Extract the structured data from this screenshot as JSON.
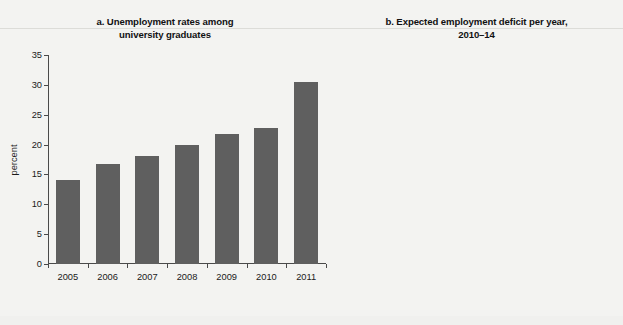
{
  "figure": {
    "background_color": "#f3f3f1",
    "panels": [
      {
        "id": "a",
        "title_lines": [
          "a.  Unemployment rates among",
          "university graduates"
        ]
      },
      {
        "id": "b",
        "title_lines": [
          "b.  Expected employment deficit per year,",
          "2010–14"
        ]
      }
    ]
  },
  "chart_data": [
    {
      "type": "bar",
      "panel": "a",
      "title": "a. Unemployment rates among university graduates",
      "xlabel": "",
      "ylabel": "percent",
      "categories": [
        "2005",
        "2006",
        "2007",
        "2008",
        "2009",
        "2010",
        "2011"
      ],
      "values": [
        14.0,
        16.8,
        18.1,
        19.9,
        21.8,
        22.8,
        30.5
      ],
      "ylim": [
        0,
        35
      ],
      "yticks": [
        0,
        5,
        10,
        15,
        20,
        25,
        30,
        35
      ],
      "ytick_labels": [
        "0",
        "5",
        "10",
        "15",
        "20",
        "25",
        "30",
        "35"
      ],
      "grid": false,
      "legend": null,
      "bar_color": "#5f5f5f"
    },
    {
      "type": "bar",
      "panel": "b",
      "title": "b. Expected employment deficit per year, 2010-14",
      "xlabel": "",
      "ylabel": "percent",
      "categories": [
        "primary",
        "basic",
        "secondary and vocational",
        "tertiary"
      ],
      "category_label_lines": [
        [
          "primary"
        ],
        [
          "basic"
        ],
        [
          "secondary",
          "and",
          "vocational"
        ],
        [
          "tertiary"
        ]
      ],
      "values": [
        6.0,
        -2.0,
        -1.3,
        26.8
      ],
      "ylim": [
        -5,
        30
      ],
      "yticks": [
        -5,
        0,
        5,
        10,
        15,
        20,
        25,
        30
      ],
      "ytick_labels": [
        "−5",
        "0",
        "5",
        "10",
        "15",
        "20",
        "25",
        "30"
      ],
      "grid": false,
      "legend": null,
      "bar_color": "#161616"
    }
  ]
}
